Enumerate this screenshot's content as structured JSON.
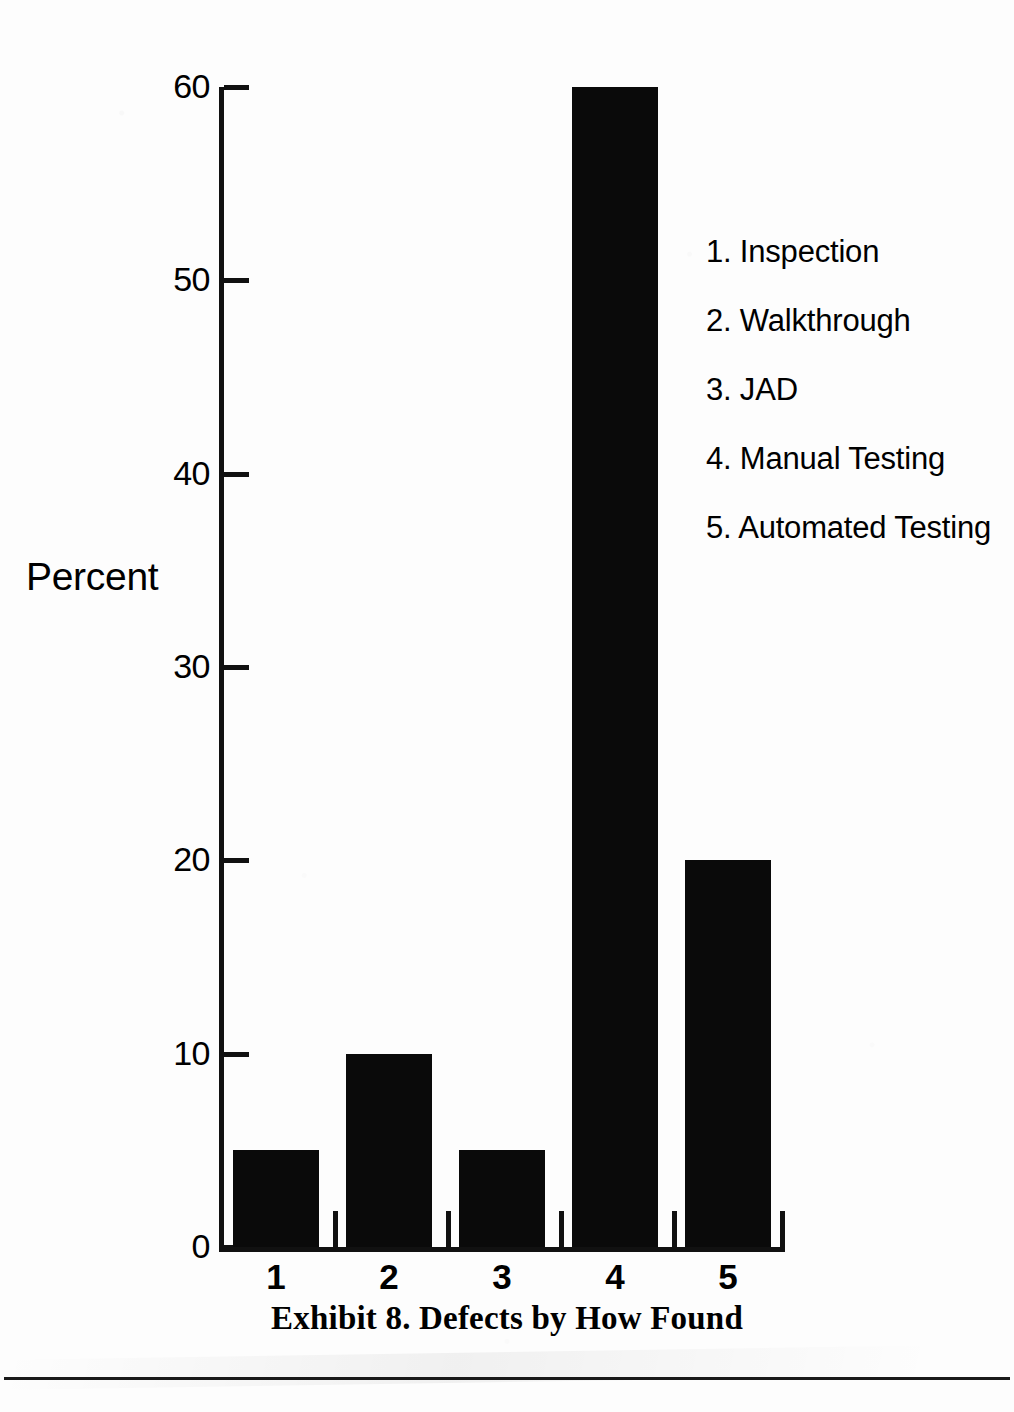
{
  "chart_data": {
    "type": "bar",
    "title": "Exhibit 8. Defects by How Found",
    "xlabel": "",
    "ylabel": "Percent",
    "categories": [
      "1",
      "2",
      "3",
      "4",
      "5"
    ],
    "values": [
      5,
      10,
      5,
      60,
      20
    ],
    "ylim": [
      0,
      60
    ],
    "yticks": [
      0,
      10,
      20,
      30,
      40,
      50,
      60
    ],
    "ytick_labels": [
      "0",
      "10",
      "20",
      "30",
      "40",
      "50",
      "60"
    ],
    "xtick_labels": [
      "1",
      "2",
      "3",
      "4",
      "5"
    ],
    "grid": false,
    "legend_position": "right",
    "bar_color": "#0a0a0a",
    "legend": [
      "1. Inspection",
      "2. Walkthrough",
      "3. JAD",
      "4. Manual Testing",
      "5. Automated Testing"
    ],
    "series": [
      {
        "name": "Percent of defects found",
        "values": [
          5,
          10,
          5,
          60,
          20
        ]
      }
    ],
    "points": [
      {
        "category": "1",
        "label": "Inspection",
        "value": 5
      },
      {
        "category": "2",
        "label": "Walkthrough",
        "value": 10
      },
      {
        "category": "3",
        "label": "JAD",
        "value": 5
      },
      {
        "category": "4",
        "label": "Manual Testing",
        "value": 60
      },
      {
        "category": "5",
        "label": "Automated Testing",
        "value": 20
      }
    ]
  },
  "axis": {
    "y_label": "Percent",
    "y_ticks": [
      "60",
      "50",
      "40",
      "30",
      "20",
      "10",
      "0"
    ],
    "x_ticks": [
      "1",
      "2",
      "3",
      "4",
      "5"
    ]
  },
  "legend": {
    "items": [
      {
        "text": "1. Inspection"
      },
      {
        "text": "2. Walkthrough"
      },
      {
        "text": "3. JAD"
      },
      {
        "text": "4. Manual Testing"
      },
      {
        "text": "5. Automated Testing"
      }
    ]
  },
  "caption": {
    "text": "Exhibit 8. Defects by How Found"
  },
  "colors": {
    "bar": "#0a0a0a",
    "axis": "#111111",
    "page": "#fdfdfd",
    "rule": "#1a1a1a"
  }
}
